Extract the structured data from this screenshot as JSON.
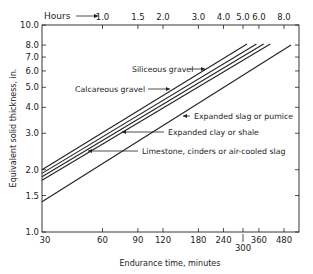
{
  "chart_data": {
    "type": "line",
    "title": "",
    "xlabel": "Endurance time, minutes",
    "ylabel": "Equivalent solid thickness, in.",
    "top_axis_label": "Hours",
    "x_scale": "log",
    "y_scale": "log",
    "xlim": [
      30,
      570
    ],
    "ylim": [
      1.0,
      10.0
    ],
    "x_ticks": [
      30,
      60,
      90,
      120,
      180,
      240,
      300,
      360,
      480
    ],
    "x_tick_labels": [
      "30",
      "60",
      "90",
      "120",
      "180",
      "240",
      "300",
      "360",
      "480"
    ],
    "top_ticks_hours": [
      1.0,
      1.5,
      2.0,
      3.0,
      4.0,
      5.0,
      6.0,
      8.0
    ],
    "top_tick_labels": [
      "1.0",
      "1.5",
      "2.0",
      "3.0",
      "4.0",
      "5.0",
      "6.0",
      "8.0"
    ],
    "y_ticks": [
      1.0,
      1.5,
      2.0,
      3.0,
      4.0,
      5.0,
      6.0,
      7.0,
      8.0,
      10.0
    ],
    "y_tick_labels": [
      "1.0",
      "1.5",
      "2.0",
      "3.0",
      "4.0",
      "5.0",
      "6.0",
      "7.0",
      "8.0",
      "10.0"
    ],
    "grid": false,
    "series": [
      {
        "name": "Siliceous gravel",
        "x": [
          30,
          314
        ],
        "y": [
          2.0,
          8.1
        ]
      },
      {
        "name": "Calcareous gravel",
        "x": [
          30,
          350
        ],
        "y": [
          1.92,
          8.1
        ]
      },
      {
        "name": "Limestone, cinders or air-cooled slag",
        "x": [
          30,
          380
        ],
        "y": [
          1.85,
          8.1
        ]
      },
      {
        "name": "Expanded clay or shale",
        "x": [
          30,
          410
        ],
        "y": [
          1.78,
          8.1
        ]
      },
      {
        "name": "Expanded slag or pumice",
        "x": [
          30,
          520
        ],
        "y": [
          1.4,
          8.0
        ]
      }
    ],
    "annotations": [
      "Siliceous gravel",
      "Calcareous gravel",
      "Expanded slag or pumice",
      "Expanded clay or shale",
      "Limestone, cinders or air-cooled slag"
    ]
  },
  "labels": {
    "hours": "Hours",
    "xlabel": "Endurance time, minutes",
    "ylabel": "Equivalent solid thickness, in.",
    "siliceous": "Siliceous gravel",
    "calcareous": "Calcareous gravel",
    "slag": "Expanded slag or pumice",
    "clay": "Expanded clay or shale",
    "limestone": "Limestone, cinders or air-cooled slag"
  }
}
